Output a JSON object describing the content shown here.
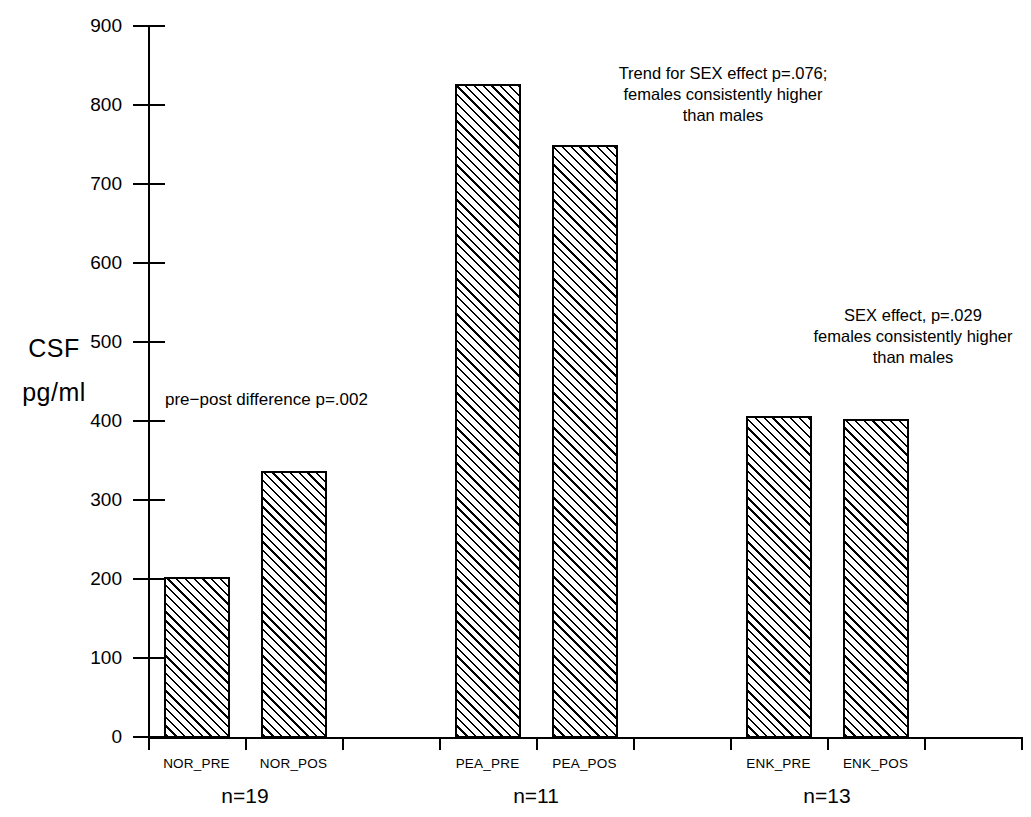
{
  "chart_data": {
    "type": "bar",
    "title": "",
    "subtitle": "",
    "xlabel": "",
    "ylabel": "CSF pg/ml",
    "ylabel_lines": [
      "CSF",
      "pg/ml"
    ],
    "ylim": [
      0,
      900
    ],
    "ytick_labels": [
      "900",
      "800",
      "700",
      "600",
      "500",
      "400",
      "300",
      "200",
      "100",
      "0"
    ],
    "ytick_values": [
      900,
      800,
      700,
      600,
      500,
      400,
      300,
      200,
      100,
      0
    ],
    "grid": false,
    "legend": "none",
    "categories": [
      "NOR_PRE",
      "NOR_POS",
      "PEA_PRE",
      "PEA_POS",
      "ENK_PRE",
      "ENK_POS"
    ],
    "values": [
      203,
      337,
      827,
      750,
      406,
      403
    ],
    "bar_fill": "diagonal-hatch",
    "bar_edge_color": "#000000",
    "groups": [
      {
        "name": "NOR",
        "n_label": "n=19",
        "n": 19,
        "categories": [
          "NOR_PRE",
          "NOR_POS"
        ]
      },
      {
        "name": "PEA",
        "n_label": "n=11",
        "n": 11,
        "categories": [
          "PEA_PRE",
          "PEA_POS"
        ]
      },
      {
        "name": "ENK",
        "n_label": "n=13",
        "n": 13,
        "categories": [
          "ENK_PRE",
          "ENK_POS"
        ]
      }
    ],
    "annotations": [
      {
        "id": "nor-annotation",
        "text": "pre−post difference p=.002",
        "align": "left"
      },
      {
        "id": "pea-annotation",
        "text": "Trend for SEX effect p=.076;\nfemales consistently higher\nthan males",
        "align": "center"
      },
      {
        "id": "enk-annotation",
        "text": "SEX effect, p=.029\nfemales consistently higher\nthan males",
        "align": "center"
      }
    ]
  },
  "axis": {
    "ylabel_line1": "CSF",
    "ylabel_line2": "pg/ml"
  },
  "yticks": [
    {
      "label": "900"
    },
    {
      "label": "800"
    },
    {
      "label": "700"
    },
    {
      "label": "600"
    },
    {
      "label": "500"
    },
    {
      "label": "400"
    },
    {
      "label": "300"
    },
    {
      "label": "200"
    },
    {
      "label": "100"
    },
    {
      "label": "0"
    }
  ],
  "bars": [
    {
      "label": "NOR_PRE",
      "value": 203
    },
    {
      "label": "NOR_POS",
      "value": 337
    },
    {
      "label": "PEA_PRE",
      "value": 827
    },
    {
      "label": "PEA_POS",
      "value": 750
    },
    {
      "label": "ENK_PRE",
      "value": 406
    },
    {
      "label": "ENK_POS",
      "value": 403
    }
  ],
  "group_labels": [
    {
      "label": "n=19"
    },
    {
      "label": "n=11"
    },
    {
      "label": "n=13"
    }
  ],
  "annotations": {
    "nor": "pre−post difference p=.002",
    "pea": "Trend for SEX effect p=.076;\nfemales consistently higher\nthan males",
    "enk": "SEX effect, p=.029\nfemales consistently higher\nthan males"
  }
}
